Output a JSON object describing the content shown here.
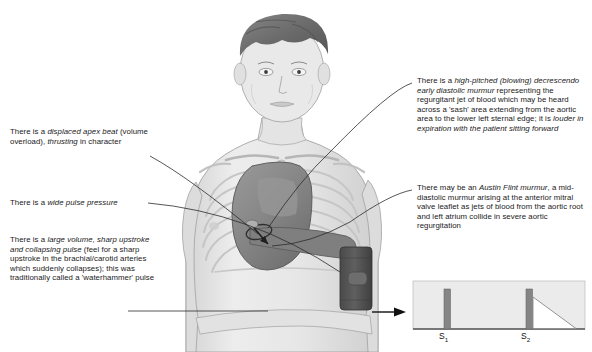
{
  "annotations": {
    "apex_beat": "There is a displaced apex beat (volume overload), thrusting in character",
    "pulse_pressure": "There is a wide pulse pressure",
    "volume_pulse": "There is a large volume, sharp upstroke and collapsing pulse (feel for a sharp upstroke in the brachial/carotid arteries which suddenly collapses); this was traditionally called a 'waterhammer' pulse",
    "early_diastolic_murmur": "There is a high-pitched (blowing) decrescendo early diastolic murmur representing the regurgitant jet of blood which may be heard across a 'sash' area extending from the aortic area to the lower left sternal edge; it is louder in expiration with the patient sitting forward",
    "austin_flint": "There may be an Austin Flint murmur, a mid-diastolic murmur arising at the anterior mitral valve leaflet as jets of blood from the aortic root and left atrium collide in severe aortic regurgitation"
  },
  "phonocardiogram": {
    "s1_label": "S",
    "s1_sub": "1",
    "s2_label": "S",
    "s2_sub": "2",
    "murmur_shape": "decrescendo triangle after S2"
  },
  "colors": {
    "background": "#ffffff",
    "text": "#1a1a1a",
    "skin": "#e9e9e9",
    "skin_shade": "#d8d8d8",
    "hair": "#6f6f6f",
    "bone": "#dcdcdc",
    "heart": "#8e8e8e",
    "heart_dark": "#6a6a6a",
    "cuff": "#5b5b5b",
    "pcg_panel": "#ebebeb",
    "pcg_bar": "#808080",
    "leader_line": "#2b2b2b"
  },
  "chart_data": {
    "type": "bar",
    "categories": [
      "S1",
      "S2"
    ],
    "values": [
      1.0,
      1.0
    ],
    "annotations": [
      "decrescendo early diastolic murmur following S2"
    ],
    "xlabel": "",
    "ylabel": "",
    "grid": false
  }
}
